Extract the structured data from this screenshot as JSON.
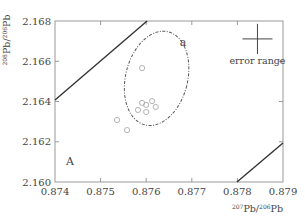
{
  "chart_data": {
    "type": "scatter",
    "title": "",
    "xlabel": "207Pb/206Pb",
    "ylabel": "208Pb/206Pb",
    "xlabel_sup": "207",
    "xlabel_sup2": "206",
    "ylabel_sup": "208",
    "ylabel_sup2": "206",
    "xlim": [
      0.874,
      0.879
    ],
    "ylim": [
      2.16,
      2.168
    ],
    "xticks": [
      0.874,
      0.875,
      0.876,
      0.877,
      0.878,
      0.879
    ],
    "xtick_labels": [
      "0.874",
      "0.875",
      "0.876",
      "0.877",
      "0.878",
      "0.879"
    ],
    "yticks": [
      2.16,
      2.162,
      2.164,
      2.166,
      2.168
    ],
    "ytick_labels": [
      "2.160",
      "2.162",
      "2.164",
      "2.166",
      "2.168"
    ],
    "grid": false,
    "series": [
      {
        "name": "samples",
        "marker": "open-circle",
        "color": "#aaaaaa",
        "points": [
          {
            "x": 0.87591,
            "y": 2.16566
          },
          {
            "x": 0.87591,
            "y": 2.16393
          },
          {
            "x": 0.876,
            "y": 2.16383
          },
          {
            "x": 0.87613,
            "y": 2.16402
          },
          {
            "x": 0.87621,
            "y": 2.16373
          },
          {
            "x": 0.87582,
            "y": 2.16358
          },
          {
            "x": 0.876,
            "y": 2.16348
          },
          {
            "x": 0.87536,
            "y": 2.16308
          },
          {
            "x": 0.87558,
            "y": 2.16258
          }
        ]
      }
    ],
    "lines": [
      {
        "name": "boundary-upper-left",
        "x": [
          0.874,
          0.87602
        ],
        "y": [
          2.16407,
          2.168
        ],
        "color": "#333333"
      },
      {
        "name": "boundary-lower-right",
        "x": [
          0.87799,
          0.879
        ],
        "y": [
          2.16,
          2.16194
        ],
        "color": "#333333"
      }
    ],
    "ellipse": {
      "label": "a",
      "style": "dash-dot",
      "center": {
        "x": 0.87625,
        "y": 2.16515
      },
      "color": "#555555"
    },
    "annotations": [
      {
        "text": "a",
        "x": 0.87681,
        "y": 2.16674
      },
      {
        "text": "A",
        "x": 0.87433,
        "y": 2.16082
      },
      {
        "text": "error range",
        "x": 0.8784,
        "y": 2.16622
      }
    ],
    "error_range": {
      "label": "error range",
      "center": {
        "x": 0.87844,
        "y": 2.16711
      },
      "half_width_x": 0.00033,
      "half_height_y": 0.00075
    },
    "legend": null
  }
}
